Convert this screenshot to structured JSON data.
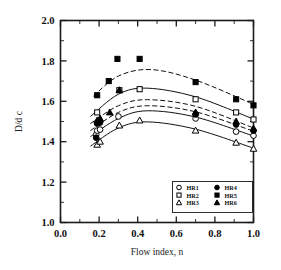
{
  "chart_data": {
    "type": "scatter",
    "title": "",
    "xlabel": "Flow index, n",
    "ylabel": "D/d c",
    "xlim": [
      0.0,
      1.0
    ],
    "ylim": [
      1.0,
      2.0
    ],
    "xticks": [
      "0.0",
      "0.2",
      "0.4",
      "0.6",
      "0.8",
      "1.0"
    ],
    "yticks": [
      "1.0",
      "1.2",
      "1.4",
      "1.6",
      "1.8",
      "2.0"
    ],
    "xtick_step": 0.2,
    "ytick_step": 0.2,
    "minor_ticks": true,
    "grid": false,
    "legend_position": "lower-right",
    "series": [
      {
        "name": "HR1",
        "marker": "open-circle",
        "line": "solid",
        "points": [
          {
            "x": 0.185,
            "y": 1.435
          },
          {
            "x": 0.19,
            "y": 1.455
          },
          {
            "x": 0.205,
            "y": 1.46
          },
          {
            "x": 0.3,
            "y": 1.525
          },
          {
            "x": 0.7,
            "y": 1.515
          },
          {
            "x": 0.91,
            "y": 1.45
          },
          {
            "x": 1.0,
            "y": 1.43
          }
        ],
        "fit": [
          {
            "x": 0.155,
            "y": 1.425
          },
          {
            "x": 0.3,
            "y": 1.515
          },
          {
            "x": 0.45,
            "y": 1.553
          },
          {
            "x": 0.7,
            "y": 1.522
          },
          {
            "x": 1.0,
            "y": 1.428
          }
        ]
      },
      {
        "name": "HR2",
        "marker": "open-square",
        "line": "solid",
        "points": [
          {
            "x": 0.19,
            "y": 1.545
          },
          {
            "x": 0.305,
            "y": 1.655
          },
          {
            "x": 0.41,
            "y": 1.66
          },
          {
            "x": 0.7,
            "y": 1.61
          },
          {
            "x": 0.91,
            "y": 1.545
          },
          {
            "x": 1.0,
            "y": 1.51
          }
        ],
        "fit": [
          {
            "x": 0.155,
            "y": 1.525
          },
          {
            "x": 0.3,
            "y": 1.635
          },
          {
            "x": 0.45,
            "y": 1.665
          },
          {
            "x": 0.7,
            "y": 1.622
          },
          {
            "x": 1.0,
            "y": 1.512
          }
        ]
      },
      {
        "name": "HR3",
        "marker": "open-triangle",
        "line": "solid",
        "points": [
          {
            "x": 0.19,
            "y": 1.385
          },
          {
            "x": 0.205,
            "y": 1.4
          },
          {
            "x": 0.305,
            "y": 1.48
          },
          {
            "x": 0.41,
            "y": 1.505
          },
          {
            "x": 0.7,
            "y": 1.455
          },
          {
            "x": 0.91,
            "y": 1.395
          },
          {
            "x": 1.0,
            "y": 1.365
          }
        ],
        "fit": [
          {
            "x": 0.155,
            "y": 1.378
          },
          {
            "x": 0.3,
            "y": 1.468
          },
          {
            "x": 0.45,
            "y": 1.498
          },
          {
            "x": 0.7,
            "y": 1.462
          },
          {
            "x": 1.0,
            "y": 1.368
          }
        ]
      },
      {
        "name": "HR4",
        "marker": "filled-circle",
        "line": "dashed",
        "points": [
          {
            "x": 0.185,
            "y": 1.42
          },
          {
            "x": 0.19,
            "y": 1.49
          },
          {
            "x": 0.205,
            "y": 1.495
          },
          {
            "x": 0.7,
            "y": 1.535
          },
          {
            "x": 0.91,
            "y": 1.485
          },
          {
            "x": 1.0,
            "y": 1.455
          }
        ],
        "fit": [
          {
            "x": 0.155,
            "y": 1.455
          },
          {
            "x": 0.3,
            "y": 1.545
          },
          {
            "x": 0.45,
            "y": 1.578
          },
          {
            "x": 0.7,
            "y": 1.548
          },
          {
            "x": 1.0,
            "y": 1.452
          }
        ]
      },
      {
        "name": "HR5",
        "marker": "filled-square",
        "line": "dashed",
        "points": [
          {
            "x": 0.19,
            "y": 1.63
          },
          {
            "x": 0.25,
            "y": 1.7
          },
          {
            "x": 0.295,
            "y": 1.81
          },
          {
            "x": 0.41,
            "y": 1.81
          },
          {
            "x": 0.7,
            "y": 1.695
          },
          {
            "x": 0.91,
            "y": 1.61
          },
          {
            "x": 1.0,
            "y": 1.58
          }
        ],
        "fit": [
          {
            "x": 0.17,
            "y": 1.625
          },
          {
            "x": 0.3,
            "y": 1.725
          },
          {
            "x": 0.47,
            "y": 1.757
          },
          {
            "x": 0.7,
            "y": 1.705
          },
          {
            "x": 1.0,
            "y": 1.585
          }
        ]
      },
      {
        "name": "HR6",
        "marker": "filled-triangle",
        "line": "dashed",
        "points": [
          {
            "x": 0.19,
            "y": 1.505
          },
          {
            "x": 0.205,
            "y": 1.515
          },
          {
            "x": 0.255,
            "y": 1.545
          },
          {
            "x": 0.305,
            "y": 1.655
          },
          {
            "x": 0.7,
            "y": 1.545
          },
          {
            "x": 0.91,
            "y": 1.5
          },
          {
            "x": 1.0,
            "y": 1.465
          }
        ],
        "fit": [
          {
            "x": 0.155,
            "y": 1.49
          },
          {
            "x": 0.3,
            "y": 1.578
          },
          {
            "x": 0.45,
            "y": 1.608
          },
          {
            "x": 0.7,
            "y": 1.575
          },
          {
            "x": 1.0,
            "y": 1.468
          }
        ]
      }
    ],
    "legend": [
      {
        "label": "HR1",
        "marker": "open-circle"
      },
      {
        "label": "HR2",
        "marker": "open-square"
      },
      {
        "label": "HR3",
        "marker": "open-triangle"
      },
      {
        "label": "HR4",
        "marker": "filled-circle"
      },
      {
        "label": "HR5",
        "marker": "filled-square"
      },
      {
        "label": "HR6",
        "marker": "filled-triangle"
      }
    ],
    "colors": {
      "ink": "#111111",
      "background": "#ffffff"
    }
  }
}
